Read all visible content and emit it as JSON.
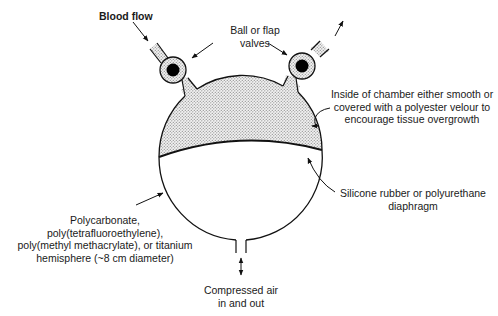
{
  "diagram": {
    "labels": {
      "blood_flow": "Blood flow",
      "valves_line1": "Ball or flap",
      "valves_line2": "valves",
      "chamber_line1": "Inside of chamber either smooth or",
      "chamber_line2": "covered with a polyester velour to",
      "chamber_line3": "encourage tissue overgrowth",
      "diaphragm_line1": "Silicone rubber or polyurethane",
      "diaphragm_line2": "diaphragm",
      "housing_line1": "Polycarbonate,",
      "housing_line2": "poly(tetrafluoroethylene),",
      "housing_line3": "poly(methyl methacrylate), or titanium",
      "housing_line4": "hemisphere (~8 cm diameter)",
      "air_line1": "Compressed air",
      "air_line2": "in and out"
    },
    "components": [
      {
        "id": "inlet-valve",
        "type": "ball valve",
        "side": "left"
      },
      {
        "id": "outlet-valve",
        "type": "ball valve",
        "side": "right"
      },
      {
        "id": "blood-chamber",
        "fill": "stippled"
      },
      {
        "id": "diaphragm",
        "material": "Silicone rubber or polyurethane"
      },
      {
        "id": "air-chamber",
        "fill": "blank"
      },
      {
        "id": "air-port",
        "flow": "bidirectional"
      }
    ],
    "colors": {
      "line": "#111111",
      "stipple": "#c9c9c9",
      "background": "#ffffff"
    }
  }
}
